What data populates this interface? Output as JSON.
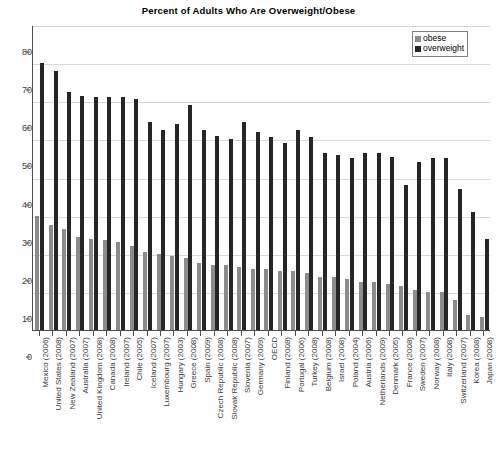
{
  "chart_data": {
    "type": "bar",
    "title": "Percent of Adults Who Are Overweight/Obese",
    "xlabel": "",
    "ylabel": "",
    "ylim": [
      0,
      80
    ],
    "yticks": [
      0,
      10,
      20,
      30,
      40,
      50,
      60,
      70,
      80
    ],
    "grid": true,
    "legend_position": "top-right",
    "categories": [
      "Mexico (2006)",
      "United States (2008)",
      "New Zealand (2007)",
      "Australia (2007)",
      "United Kingdom (2008)",
      "Canada (2008)",
      "Ireland (2007)",
      "Chile (2005)",
      "Iceland (2007)",
      "Luxembourg (2007)",
      "Hungary (2003)",
      "Greece (2008)",
      "Spain (2009)",
      "Czech Republic (2008)",
      "Slovak Republic (2008)",
      "Slovenia (2007)",
      "Germany (2009)",
      "OECD",
      "Finland (2008)",
      "Portugal (2006)",
      "Turkey (2008)",
      "Belgium (2008)",
      "Israel (2008)",
      "Poland (2004)",
      "Austria (2006)",
      "Netherlands (2009)",
      "Denmark (2005)",
      "France (2008)",
      "Sweden (2007)",
      "Norway (2008)",
      "Italy (2008)",
      "Switzerland (2007)",
      "Korea (2008)",
      "Japan (2008)"
    ],
    "series": [
      {
        "name": "obese",
        "color": "#8c8c8c",
        "values": [
          30,
          27.5,
          26.5,
          24.5,
          24,
          23.5,
          23,
          22,
          20.5,
          20,
          19.5,
          19,
          17.5,
          17,
          17,
          16.5,
          16,
          16,
          15.5,
          15.5,
          15,
          14,
          14,
          13.5,
          12.5,
          12.5,
          12,
          11.5,
          10.5,
          10,
          10,
          8,
          4,
          3.5
        ]
      },
      {
        "name": "overweight",
        "color": "#262626",
        "values": [
          70,
          68,
          62.5,
          61.5,
          61,
          61,
          61,
          60.5,
          54.5,
          52.5,
          54,
          59,
          52.5,
          51,
          50,
          54.5,
          52,
          50.5,
          49,
          52.5,
          50.5,
          46.5,
          46,
          45,
          46.5,
          46.5,
          45.5,
          38,
          44,
          45,
          45,
          37,
          31,
          24
        ]
      }
    ]
  },
  "legend": {
    "entries": [
      {
        "label": "obese",
        "color": "#8c8c8c"
      },
      {
        "label": "overweight",
        "color": "#262626"
      }
    ]
  },
  "axis": {
    "y_tick_labels": [
      "0",
      "10",
      "20",
      "30",
      "40",
      "50",
      "60",
      "70",
      "80"
    ]
  }
}
